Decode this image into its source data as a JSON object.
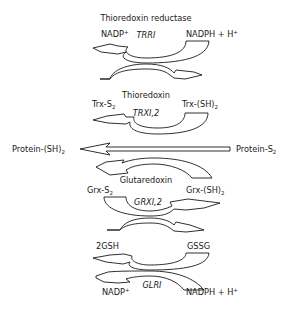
{
  "stages": [
    {
      "id": "thioredoxin-reductase",
      "title": "Thioredoxin reductase",
      "enzyme": "TRRI",
      "left_top": "NADP",
      "left_top_sup": "+",
      "right_top": "NADPH + H",
      "right_top_sup": "+"
    },
    {
      "id": "thioredoxin",
      "title": "Thioredoxin",
      "enzyme": "TRXI,2",
      "left_top": "Trx-S",
      "left_top_sub": "2",
      "right_top": "Trx-(SH)",
      "right_top_sub": "2"
    },
    {
      "id": "protein",
      "left": "Protein-(SH)",
      "left_sub": "2",
      "right": "Protein-S",
      "right_sub": "2"
    },
    {
      "id": "glutaredoxin",
      "title": "Glutaredoxin",
      "enzyme": "GRXI,2",
      "left_top": "Grx-S",
      "left_top_sub": "2",
      "right_top": "Grx-(SH)",
      "right_top_sub": "2"
    },
    {
      "id": "glutathione-reductase",
      "enzyme": "GLRI",
      "left_top": "2GSH",
      "right_top": "GSSG",
      "left_bottom": "NADP",
      "left_bottom_sup": "+",
      "right_bottom": "NADPH + H",
      "right_bottom_sup": "+"
    }
  ]
}
